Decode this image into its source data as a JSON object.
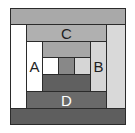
{
  "diagram": {
    "type": "log-cabin-square",
    "blocks": [
      {
        "id": "top-band",
        "label": "",
        "x": 10,
        "y": 8,
        "w": 116,
        "h": 17,
        "color": "#a9a9a9"
      },
      {
        "id": "left-column",
        "label": "",
        "x": 10,
        "y": 24,
        "w": 17,
        "h": 85,
        "color": "#ffffff"
      },
      {
        "id": "right-column",
        "label": "",
        "x": 106,
        "y": 24,
        "w": 20,
        "h": 85,
        "color": "#d9d9d9"
      },
      {
        "id": "bottom-band",
        "label": "",
        "x": 10,
        "y": 108,
        "w": 116,
        "h": 17,
        "color": "#5e5e5e"
      },
      {
        "id": "C",
        "label": "C",
        "x": 26,
        "y": 24,
        "w": 81,
        "h": 18,
        "color": "#b0b0b0"
      },
      {
        "id": "A",
        "label": "A",
        "x": 26,
        "y": 41,
        "w": 17,
        "h": 51,
        "color": "#ffffff"
      },
      {
        "id": "B",
        "label": "B",
        "x": 90,
        "y": 41,
        "w": 17,
        "h": 51,
        "color": "#d6d6d6"
      },
      {
        "id": "D",
        "label": "D",
        "x": 26,
        "y": 91,
        "w": 81,
        "h": 18,
        "color": "#6a6a6a",
        "label_color": "#ffffff"
      },
      {
        "id": "inner-top",
        "label": "",
        "x": 42,
        "y": 41,
        "w": 49,
        "h": 17,
        "color": "#a6a6a6"
      },
      {
        "id": "center-left",
        "label": "",
        "x": 42,
        "y": 57,
        "w": 17,
        "h": 18,
        "color": "#ffffff"
      },
      {
        "id": "center",
        "label": "",
        "x": 58,
        "y": 57,
        "w": 17,
        "h": 18,
        "color": "#888888"
      },
      {
        "id": "center-right",
        "label": "",
        "x": 74,
        "y": 57,
        "w": 17,
        "h": 18,
        "color": "#d6d6d6"
      },
      {
        "id": "inner-bottom",
        "label": "",
        "x": 42,
        "y": 74,
        "w": 49,
        "h": 18,
        "color": "#606060"
      }
    ]
  }
}
